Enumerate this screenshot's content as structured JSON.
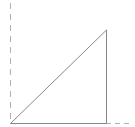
{
  "diagram": {
    "type": "right-triangle-on-axes",
    "colors": {
      "background": "#ffffff",
      "triangle_stroke": "#888888",
      "axis_dash": "#b0b0b0"
    },
    "axes": {
      "vertical": {
        "x": 10.5,
        "y1": 3,
        "y2": 123,
        "style": "dashed"
      },
      "horizontal_extension": {
        "y": 123.5,
        "x1": 106,
        "x2": 132,
        "style": "dashed"
      }
    },
    "triangle": {
      "origin": [
        10.5,
        123.5
      ],
      "base_end": [
        106.5,
        123.5
      ],
      "apex": [
        106.5,
        30
      ]
    }
  }
}
